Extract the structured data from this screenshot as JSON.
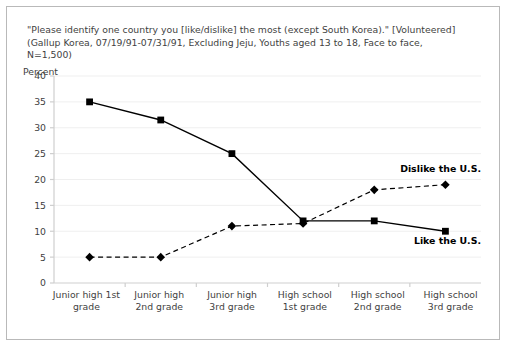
{
  "title": {
    "line1": "\"Please identify one country you [like/dislike] the most (except South Korea).\" [Volunteered]",
    "line2": "(Gallup Korea, 07/19/91-07/31/91, Excluding Jeju, Youths aged 13 to 18, Face to face,",
    "line3": "N=1,500)"
  },
  "axis_unit_label": "Percent",
  "y_ticks": [
    "40",
    "35",
    "30",
    "25",
    "20",
    "15",
    "10",
    "5",
    "0"
  ],
  "x_categories": [
    {
      "top": "Junior high 1st",
      "bottom": "grade"
    },
    {
      "top": "Junior high",
      "bottom": "2nd grade"
    },
    {
      "top": "Junior high",
      "bottom": "3rd grade"
    },
    {
      "top": "High school",
      "bottom": "1st grade"
    },
    {
      "top": "High school",
      "bottom": "2nd grade"
    },
    {
      "top": "High school",
      "bottom": "3rd grade"
    }
  ],
  "annotations": {
    "dislike": "Dislike the U.S.",
    "like": "Like the U.S."
  },
  "colors": {
    "line": "#000000",
    "marker": "#000000",
    "grid": "#efefef",
    "axis": "#cfcfcf",
    "border": "#b9b9b9",
    "text": "#3f3f3f"
  },
  "chart_data": {
    "type": "line",
    "title": "\"Please identify one country you [like/dislike] the most (except South Korea).\" [Volunteered] (Gallup Korea, 07/19/91-07/31/91, Excluding Jeju, Youths aged 13 to 18, Face to face, N=1,500)",
    "xlabel": "",
    "ylabel": "Percent",
    "ylim": [
      0,
      40
    ],
    "ytick_step": 5,
    "grid": true,
    "legend": "inline-annotation",
    "categories": [
      "Junior high 1st grade",
      "Junior high 2nd grade",
      "Junior high 3rd grade",
      "High school 1st grade",
      "High school 2nd grade",
      "High school 3rd grade"
    ],
    "series": [
      {
        "name": "Like the U.S.",
        "marker": "square",
        "linestyle": "solid",
        "values": [
          35,
          31.5,
          25,
          12,
          12,
          10
        ]
      },
      {
        "name": "Dislike the U.S.",
        "marker": "diamond",
        "linestyle": "dashed",
        "values": [
          5,
          5,
          11,
          11.5,
          18,
          19
        ]
      }
    ]
  }
}
